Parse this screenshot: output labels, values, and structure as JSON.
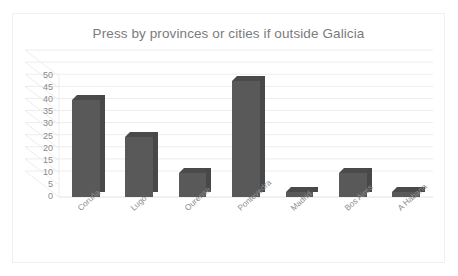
{
  "chart_data": {
    "type": "bar",
    "title": "Press by provinces or cities if outside Galicia",
    "xlabel": "",
    "ylabel": "",
    "ylim": [
      0,
      50
    ],
    "ytick_step": 5,
    "yticks": [
      "50",
      "45",
      "40",
      "35",
      "30",
      "25",
      "20",
      "15",
      "10",
      "5",
      "0"
    ],
    "grid": true,
    "legend": "none",
    "style": "3d-column",
    "bar_color": "#595959",
    "title_color": "#7b7b7b",
    "axis_label_color": "#8a8a8a",
    "categories": [
      "Coruña",
      "Lugo",
      "Ourense",
      "Pontevedra",
      "Madrid",
      "Bos Aires",
      "A Habana"
    ],
    "values": [
      40,
      25,
      10,
      48,
      2,
      10,
      2
    ]
  }
}
